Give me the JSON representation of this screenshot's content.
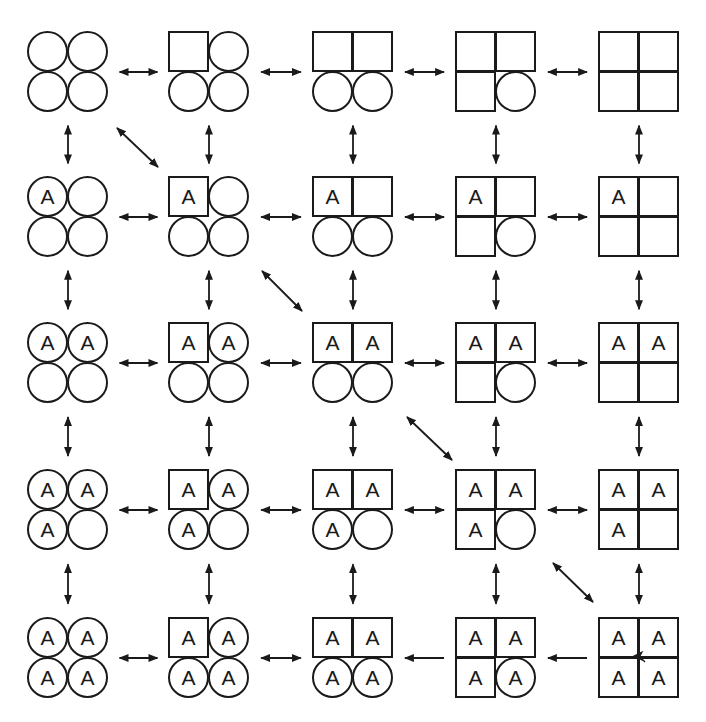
{
  "diagram": {
    "title": "",
    "grid": {
      "rows": 5,
      "cols": 5
    },
    "position_order": [
      "top-left",
      "top-right",
      "bottom-left",
      "bottom-right"
    ],
    "label_text": "A",
    "legend": {
      "circle": "circle position",
      "square": "square position",
      "A": "occupied by A"
    },
    "cells": [
      [
        {
          "shapes": [
            "circle",
            "circle",
            "circle",
            "circle"
          ],
          "labels": [
            "",
            "",
            "",
            ""
          ]
        },
        {
          "shapes": [
            "square",
            "circle",
            "circle",
            "circle"
          ],
          "labels": [
            "",
            "",
            "",
            ""
          ]
        },
        {
          "shapes": [
            "square",
            "square",
            "circle",
            "circle"
          ],
          "labels": [
            "",
            "",
            "",
            ""
          ]
        },
        {
          "shapes": [
            "square",
            "square",
            "square",
            "circle"
          ],
          "labels": [
            "",
            "",
            "",
            ""
          ]
        },
        {
          "shapes": [
            "square",
            "square",
            "square",
            "square"
          ],
          "labels": [
            "",
            "",
            "",
            ""
          ]
        }
      ],
      [
        {
          "shapes": [
            "circle",
            "circle",
            "circle",
            "circle"
          ],
          "labels": [
            "A",
            "",
            "",
            ""
          ]
        },
        {
          "shapes": [
            "square",
            "circle",
            "circle",
            "circle"
          ],
          "labels": [
            "A",
            "",
            "",
            ""
          ]
        },
        {
          "shapes": [
            "square",
            "square",
            "circle",
            "circle"
          ],
          "labels": [
            "A",
            "",
            "",
            ""
          ]
        },
        {
          "shapes": [
            "square",
            "square",
            "square",
            "circle"
          ],
          "labels": [
            "A",
            "",
            "",
            ""
          ]
        },
        {
          "shapes": [
            "square",
            "square",
            "square",
            "square"
          ],
          "labels": [
            "A",
            "",
            "",
            ""
          ]
        }
      ],
      [
        {
          "shapes": [
            "circle",
            "circle",
            "circle",
            "circle"
          ],
          "labels": [
            "A",
            "A",
            "",
            ""
          ]
        },
        {
          "shapes": [
            "square",
            "circle",
            "circle",
            "circle"
          ],
          "labels": [
            "A",
            "A",
            "",
            ""
          ]
        },
        {
          "shapes": [
            "square",
            "square",
            "circle",
            "circle"
          ],
          "labels": [
            "A",
            "A",
            "",
            ""
          ]
        },
        {
          "shapes": [
            "square",
            "square",
            "square",
            "circle"
          ],
          "labels": [
            "A",
            "A",
            "",
            ""
          ]
        },
        {
          "shapes": [
            "square",
            "square",
            "square",
            "square"
          ],
          "labels": [
            "A",
            "A",
            "",
            ""
          ]
        }
      ],
      [
        {
          "shapes": [
            "circle",
            "circle",
            "circle",
            "circle"
          ],
          "labels": [
            "A",
            "A",
            "A",
            ""
          ]
        },
        {
          "shapes": [
            "square",
            "circle",
            "circle",
            "circle"
          ],
          "labels": [
            "A",
            "A",
            "A",
            ""
          ]
        },
        {
          "shapes": [
            "square",
            "square",
            "circle",
            "circle"
          ],
          "labels": [
            "A",
            "A",
            "A",
            ""
          ]
        },
        {
          "shapes": [
            "square",
            "square",
            "square",
            "circle"
          ],
          "labels": [
            "A",
            "A",
            "A",
            ""
          ]
        },
        {
          "shapes": [
            "square",
            "square",
            "square",
            "square"
          ],
          "labels": [
            "A",
            "A",
            "A",
            ""
          ]
        }
      ],
      [
        {
          "shapes": [
            "circle",
            "circle",
            "circle",
            "circle"
          ],
          "labels": [
            "A",
            "A",
            "A",
            "A"
          ]
        },
        {
          "shapes": [
            "square",
            "circle",
            "circle",
            "circle"
          ],
          "labels": [
            "A",
            "A",
            "A",
            "A"
          ]
        },
        {
          "shapes": [
            "square",
            "square",
            "circle",
            "circle"
          ],
          "labels": [
            "A",
            "A",
            "A",
            "A"
          ]
        },
        {
          "shapes": [
            "square",
            "square",
            "square",
            "circle"
          ],
          "labels": [
            "A",
            "A",
            "A",
            "A"
          ]
        },
        {
          "shapes": [
            "square",
            "square",
            "square",
            "square"
          ],
          "labels": [
            "A",
            "A",
            "A",
            "A"
          ]
        }
      ]
    ],
    "layout": {
      "col_left": [
        27,
        168,
        312,
        455,
        598
      ],
      "row_top": [
        31,
        176,
        322,
        469,
        617
      ],
      "cell_size": 82
    },
    "horizontal_arrows": [
      [
        "both",
        "both",
        "both",
        "both"
      ],
      [
        "both",
        "both",
        "both",
        "both"
      ],
      [
        "both",
        "both",
        "both",
        "both"
      ],
      [
        "both",
        "both",
        "both",
        "both"
      ],
      [
        "both",
        "both",
        "left",
        "left"
      ]
    ],
    "vertical_arrows": [
      [
        "both",
        "both",
        "both",
        "both",
        "both"
      ],
      [
        "both",
        "both",
        "both",
        "both",
        "both"
      ],
      [
        "both",
        "both",
        "both",
        "both",
        "both"
      ],
      [
        "both",
        "both",
        "both",
        "both",
        "both"
      ]
    ],
    "diagonal_arrows": [
      {
        "from": [
          0,
          0
        ],
        "to": [
          1,
          1
        ],
        "x1": 117,
        "y1": 128,
        "x2": 158,
        "y2": 167,
        "type": "both"
      },
      {
        "from": [
          1,
          1
        ],
        "to": [
          2,
          2
        ],
        "x1": 262,
        "y1": 271,
        "x2": 302,
        "y2": 311,
        "type": "both"
      },
      {
        "from": [
          2,
          2
        ],
        "to": [
          3,
          3
        ],
        "x1": 407,
        "y1": 417,
        "x2": 452,
        "y2": 460,
        "type": "both"
      },
      {
        "from": [
          3,
          3
        ],
        "to": [
          4,
          4
        ],
        "x1": 553,
        "y1": 563,
        "x2": 593,
        "y2": 602,
        "type": "both"
      }
    ],
    "center_mark": {
      "cell": [
        4,
        4
      ],
      "x": 639,
      "y": 656,
      "type": "arrowhead-left"
    },
    "colors": {
      "stroke": "#1a1a1a",
      "background": "#ffffff"
    }
  }
}
